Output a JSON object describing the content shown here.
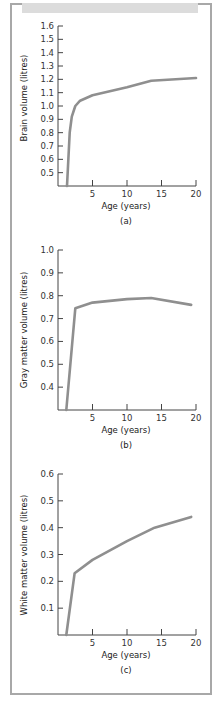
{
  "chart_data": [
    {
      "type": "line",
      "panel_label": "(a)",
      "title": "",
      "xlabel": "Age (years)",
      "ylabel": "Brain volume (litres)",
      "x_ticks": [
        "5",
        "10",
        "15",
        "20"
      ],
      "y_ticks": [
        "0.5",
        "0.6",
        "0.7",
        "0.8",
        "0.9",
        "1.0",
        "1.1",
        "1.2",
        "1.3",
        "1.4",
        "1.5",
        "1.6"
      ],
      "xlim": [
        0,
        20
      ],
      "ylim": [
        0.4,
        1.6
      ],
      "grid": false,
      "series": [
        {
          "name": "Brain volume",
          "x": [
            1.3,
            1.7,
            2.0,
            2.5,
            3.2,
            5,
            10,
            13.5,
            20
          ],
          "y": [
            0.4,
            0.8,
            0.92,
            1.0,
            1.04,
            1.08,
            1.14,
            1.19,
            1.21
          ]
        }
      ]
    },
    {
      "type": "line",
      "panel_label": "(b)",
      "title": "",
      "xlabel": "Age (years)",
      "ylabel": "Gray matter volume (litres)",
      "x_ticks": [
        "5",
        "10",
        "15",
        "20"
      ],
      "y_ticks": [
        "0.4",
        "0.5",
        "0.6",
        "0.7",
        "0.8",
        "0.9",
        "1.0"
      ],
      "xlim": [
        0,
        20
      ],
      "ylim": [
        0.3,
        1.0
      ],
      "grid": false,
      "series": [
        {
          "name": "Gray matter volume",
          "x": [
            1.2,
            2.5,
            5,
            10,
            13.5,
            19.3
          ],
          "y": [
            0.3,
            0.745,
            0.77,
            0.785,
            0.79,
            0.76
          ]
        }
      ]
    },
    {
      "type": "line",
      "panel_label": "(c)",
      "title": "",
      "xlabel": "Age (years)",
      "ylabel": "White matter volume (litres)",
      "x_ticks": [
        "5",
        "10",
        "15",
        "20"
      ],
      "y_ticks": [
        "0.1",
        "0.2",
        "0.3",
        "0.4",
        "0.5",
        "0.6"
      ],
      "xlim": [
        0,
        20
      ],
      "ylim": [
        0.0,
        0.6
      ],
      "grid": false,
      "series": [
        {
          "name": "White matter volume",
          "x": [
            1.2,
            2.4,
            5,
            10,
            14,
            19.3
          ],
          "y": [
            0.0,
            0.23,
            0.28,
            0.35,
            0.4,
            0.44
          ]
        }
      ]
    }
  ],
  "colors": {
    "curve": "#8f8f8f",
    "axis": "#444444",
    "frame": "#a8a8a8",
    "header_band": "#dcdcdc"
  },
  "panels": {
    "a": {
      "ylabel": "Brain volume (litres)",
      "xlabel": "Age (years)",
      "caption": "(a)"
    },
    "b": {
      "ylabel": "Gray matter volume (litres)",
      "xlabel": "Age (years)",
      "caption": "(b)"
    },
    "c": {
      "ylabel": "White matter volume (litres)",
      "xlabel": "Age (years)",
      "caption": "(c)"
    }
  }
}
